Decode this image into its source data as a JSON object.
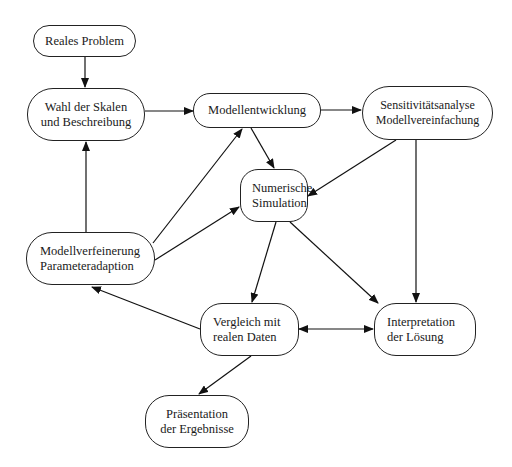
{
  "diagram": {
    "type": "flowchart",
    "nodes": [
      {
        "id": "reales_problem",
        "lines": [
          "Reales Problem"
        ]
      },
      {
        "id": "wahl_skalen",
        "lines": [
          "Wahl der Skalen",
          "und Beschreibung"
        ]
      },
      {
        "id": "modellentwicklung",
        "lines": [
          "Modellentwicklung"
        ]
      },
      {
        "id": "sensitivitaet",
        "lines": [
          "Sensitivitätsanalyse",
          "Modellvereinfachung"
        ]
      },
      {
        "id": "numerische_simulation",
        "lines": [
          "Numerische",
          "Simulation"
        ]
      },
      {
        "id": "modellverfeinerung",
        "lines": [
          "Modellverfeinerung",
          "Parameteradaption"
        ]
      },
      {
        "id": "vergleich",
        "lines": [
          "Vergleich mit",
          "realen Daten"
        ]
      },
      {
        "id": "interpretation",
        "lines": [
          "Interpretation",
          "der Lösung"
        ]
      },
      {
        "id": "praesentation",
        "lines": [
          "Präsentation",
          "der Ergebnisse"
        ]
      }
    ],
    "edges": [
      {
        "from": "reales_problem",
        "to": "wahl_skalen"
      },
      {
        "from": "wahl_skalen",
        "to": "modellentwicklung"
      },
      {
        "from": "modellentwicklung",
        "to": "sensitivitaet"
      },
      {
        "from": "modellentwicklung",
        "to": "numerische_simulation"
      },
      {
        "from": "sensitivitaet",
        "to": "numerische_simulation"
      },
      {
        "from": "sensitivitaet",
        "to": "interpretation"
      },
      {
        "from": "modellverfeinerung",
        "to": "wahl_skalen"
      },
      {
        "from": "modellverfeinerung",
        "to": "modellentwicklung"
      },
      {
        "from": "modellverfeinerung",
        "to": "numerische_simulation"
      },
      {
        "from": "numerische_simulation",
        "to": "vergleich"
      },
      {
        "from": "numerische_simulation",
        "to": "interpretation"
      },
      {
        "from": "vergleich",
        "to": "modellverfeinerung"
      },
      {
        "from": "vergleich",
        "to": "interpretation",
        "bidirectional": true
      },
      {
        "from": "vergleich",
        "to": "praesentation"
      }
    ]
  }
}
